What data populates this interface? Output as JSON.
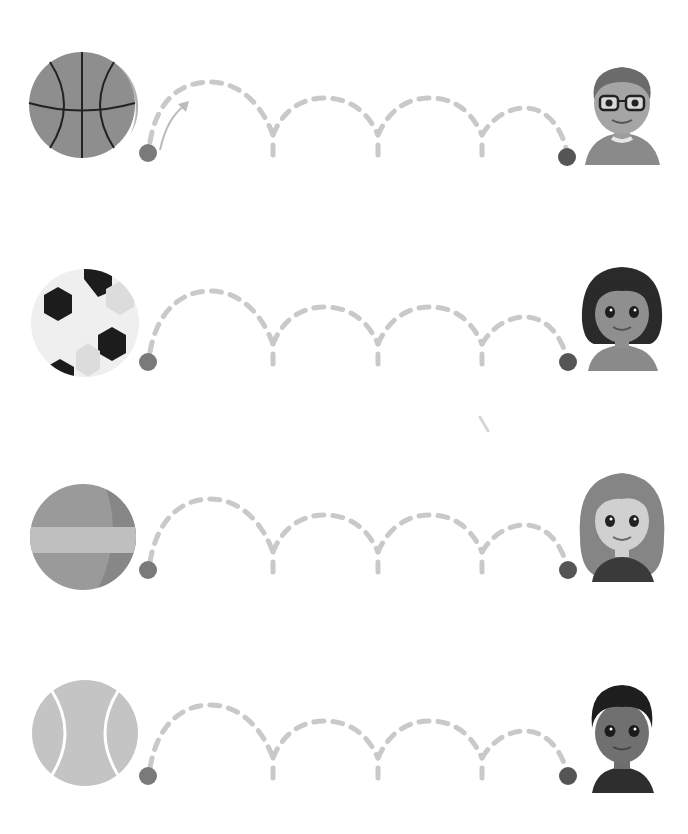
{
  "worksheet": {
    "type": "trace-the-bouncing-ball",
    "instruction_arrow": "arrow-icon",
    "colors": {
      "background": "#ffffff",
      "dash": "#c9c9c9",
      "dot": "#7a7a7a",
      "end_dot": "#555555"
    },
    "rows": [
      {
        "ball": "basketball",
        "ball_color": "#8e8e8e",
        "child": "boy-with-glasses",
        "start_dot": [
          148,
          153
        ],
        "end_dot": [
          567,
          157
        ],
        "has_arrow": true
      },
      {
        "ball": "soccer-ball",
        "ball_color": "#efefef",
        "child": "girl-dark-hair",
        "start_dot": [
          148,
          362
        ],
        "end_dot": [
          568,
          362
        ],
        "has_arrow": false
      },
      {
        "ball": "beach-ball",
        "ball_color": "#9a9a9a",
        "child": "girl-long-hair",
        "start_dot": [
          148,
          570
        ],
        "end_dot": [
          568,
          570
        ],
        "has_arrow": false
      },
      {
        "ball": "tennis-ball",
        "ball_color": "#c4c4c4",
        "child": "boy-dark-hair",
        "start_dot": [
          148,
          776
        ],
        "end_dot": [
          568,
          776
        ],
        "has_arrow": false
      }
    ]
  }
}
